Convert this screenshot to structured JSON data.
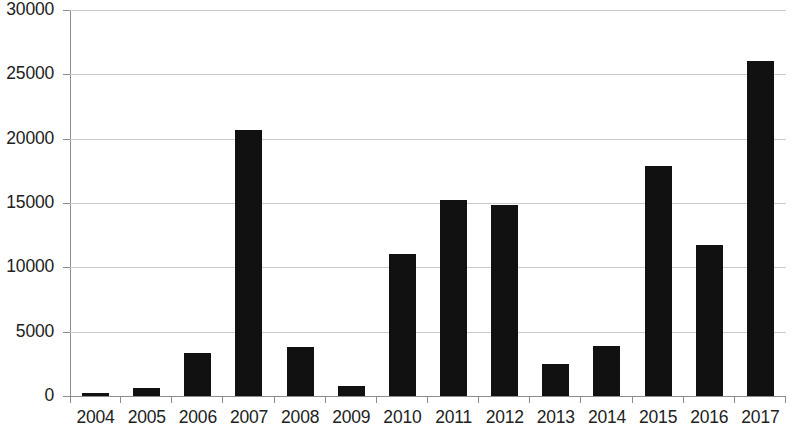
{
  "chart_data": {
    "type": "bar",
    "title": "",
    "subtitle": "",
    "xlabel": "",
    "ylabel": "",
    "categories": [
      "2004",
      "2005",
      "2006",
      "2007",
      "2008",
      "2009",
      "2010",
      "2011",
      "2012",
      "2013",
      "2014",
      "2015",
      "2016",
      "2017"
    ],
    "values": [
      200,
      600,
      3350,
      20650,
      3800,
      800,
      11000,
      15250,
      14850,
      2500,
      3850,
      17850,
      11700,
      26000
    ],
    "series": [
      {
        "name": "",
        "values": [
          200,
          600,
          3350,
          20650,
          3800,
          800,
          11000,
          15250,
          14850,
          2500,
          3850,
          17850,
          11700,
          26000
        ]
      }
    ],
    "ylim": [
      0,
      30000
    ],
    "ytick_values": [
      0,
      5000,
      10000,
      15000,
      20000,
      25000,
      30000
    ],
    "ytick_labels": [
      "0",
      "5000",
      "10000",
      "15000",
      "20000",
      "25000",
      "30000"
    ],
    "grid": "horizontal",
    "legend": "none",
    "bar_color": "#111111",
    "gridline_color": "#c9c9c9",
    "axis_color": "#8c8c8c",
    "background_color": "#ffffff"
  }
}
